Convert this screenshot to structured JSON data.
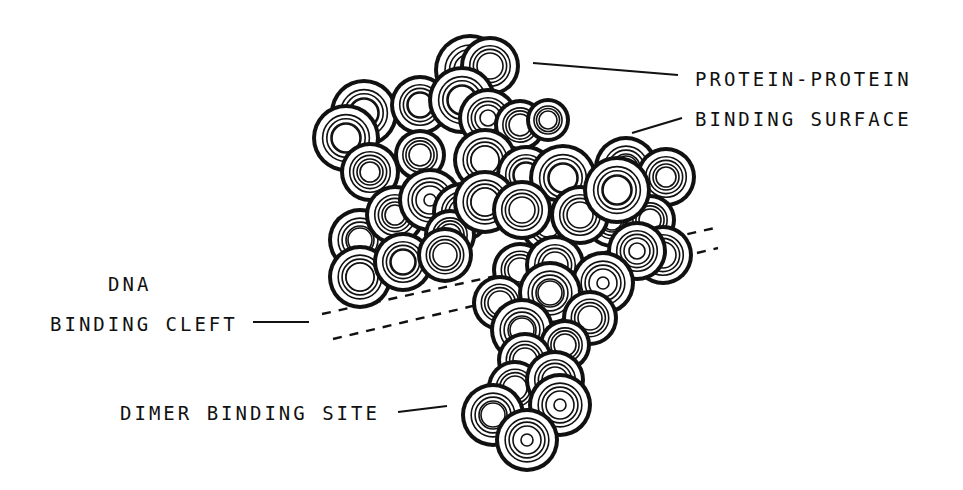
{
  "figure": {
    "type": "space-filling protein structure drawing",
    "ink_color": "#111111",
    "paper_color": "#ffffff"
  },
  "labels": {
    "protein_protein_line1": "PROTEIN-PROTEIN",
    "protein_protein_line2": "BINDING SURFACE",
    "dna_line1": "DNA",
    "dna_line2": "BINDING CLEFT",
    "dimer": "DIMER BINDING SITE"
  },
  "label_positions": {
    "protein_protein_line1": [
      695,
      70
    ],
    "protein_protein_line2": [
      695,
      110
    ],
    "dna_line1": [
      108,
      275
    ],
    "dna_line2": [
      50,
      315
    ],
    "dimer": [
      120,
      404
    ]
  },
  "leader_lines": [
    {
      "name": "protein-protein-leader-top",
      "x1": 533,
      "y1": 63,
      "x2": 678,
      "y2": 75
    },
    {
      "name": "protein-protein-leader-bottom",
      "x1": 632,
      "y1": 133,
      "x2": 682,
      "y2": 118
    },
    {
      "name": "dna-cleft-leader",
      "x1": 253,
      "y1": 322,
      "x2": 309,
      "y2": 322
    },
    {
      "name": "dimer-site-leader",
      "x1": 398,
      "y1": 412,
      "x2": 447,
      "y2": 406
    }
  ],
  "dashed_lines": [
    {
      "name": "dna-cleft-dash-upper",
      "x1": 322,
      "y1": 314,
      "x2": 715,
      "y2": 228
    },
    {
      "name": "dna-cleft-dash-lower",
      "x1": 333,
      "y1": 339,
      "x2": 718,
      "y2": 248
    }
  ],
  "atoms": [
    {
      "cx": 470,
      "cy": 70,
      "r": 36,
      "core": 0
    },
    {
      "cx": 490,
      "cy": 66,
      "r": 30,
      "core": 0
    },
    {
      "cx": 364,
      "cy": 113,
      "r": 34,
      "core": 14
    },
    {
      "cx": 346,
      "cy": 138,
      "r": 34,
      "core": 14
    },
    {
      "cx": 420,
      "cy": 105,
      "r": 30,
      "core": 12
    },
    {
      "cx": 462,
      "cy": 100,
      "r": 34,
      "core": 14
    },
    {
      "cx": 488,
      "cy": 118,
      "r": 30,
      "core": 8
    },
    {
      "cx": 520,
      "cy": 125,
      "r": 26,
      "core": 0
    },
    {
      "cx": 548,
      "cy": 120,
      "r": 22,
      "core": 0
    },
    {
      "cx": 370,
      "cy": 172,
      "r": 30,
      "core": 10
    },
    {
      "cx": 420,
      "cy": 155,
      "r": 26,
      "core": 0
    },
    {
      "cx": 485,
      "cy": 160,
      "r": 32,
      "core": 14
    },
    {
      "cx": 526,
      "cy": 175,
      "r": 30,
      "core": 12
    },
    {
      "cx": 563,
      "cy": 178,
      "r": 34,
      "core": 14
    },
    {
      "cx": 626,
      "cy": 168,
      "r": 32,
      "core": 12
    },
    {
      "cx": 666,
      "cy": 177,
      "r": 30,
      "core": 10
    },
    {
      "cx": 612,
      "cy": 220,
      "r": 28,
      "core": 10
    },
    {
      "cx": 650,
      "cy": 220,
      "r": 26,
      "core": 0
    },
    {
      "cx": 548,
      "cy": 225,
      "r": 28,
      "core": 0
    },
    {
      "cx": 360,
      "cy": 240,
      "r": 32,
      "core": 12
    },
    {
      "cx": 395,
      "cy": 215,
      "r": 30,
      "core": 10
    },
    {
      "cx": 430,
      "cy": 200,
      "r": 32,
      "core": 6
    },
    {
      "cx": 462,
      "cy": 212,
      "r": 30,
      "core": 6
    },
    {
      "cx": 450,
      "cy": 235,
      "r": 26,
      "core": 0
    },
    {
      "cx": 360,
      "cy": 277,
      "r": 32,
      "core": 14
    },
    {
      "cx": 403,
      "cy": 262,
      "r": 30,
      "core": 12
    },
    {
      "cx": 445,
      "cy": 255,
      "r": 28,
      "core": 0
    },
    {
      "cx": 485,
      "cy": 202,
      "r": 32,
      "core": 14
    },
    {
      "cx": 522,
      "cy": 210,
      "r": 30,
      "core": 0
    },
    {
      "cx": 580,
      "cy": 215,
      "r": 30,
      "core": 0
    },
    {
      "cx": 617,
      "cy": 190,
      "r": 34,
      "core": 14
    },
    {
      "cx": 663,
      "cy": 255,
      "r": 30,
      "core": 0
    },
    {
      "cx": 637,
      "cy": 251,
      "r": 30,
      "core": 8
    },
    {
      "cx": 520,
      "cy": 270,
      "r": 28,
      "core": 0
    },
    {
      "cx": 555,
      "cy": 265,
      "r": 30,
      "core": 0
    },
    {
      "cx": 603,
      "cy": 283,
      "r": 32,
      "core": 6
    },
    {
      "cx": 500,
      "cy": 303,
      "r": 28,
      "core": 0
    },
    {
      "cx": 550,
      "cy": 293,
      "r": 32,
      "core": 12
    },
    {
      "cx": 590,
      "cy": 318,
      "r": 28,
      "core": 0
    },
    {
      "cx": 522,
      "cy": 330,
      "r": 32,
      "core": 12
    },
    {
      "cx": 565,
      "cy": 345,
      "r": 26,
      "core": 0
    },
    {
      "cx": 525,
      "cy": 360,
      "r": 28,
      "core": 0
    },
    {
      "cx": 515,
      "cy": 388,
      "r": 28,
      "core": 0
    },
    {
      "cx": 555,
      "cy": 380,
      "r": 30,
      "core": 0
    },
    {
      "cx": 493,
      "cy": 415,
      "r": 32,
      "core": 12
    },
    {
      "cx": 560,
      "cy": 405,
      "r": 32,
      "core": 6
    },
    {
      "cx": 527,
      "cy": 440,
      "r": 32,
      "core": 6
    }
  ]
}
